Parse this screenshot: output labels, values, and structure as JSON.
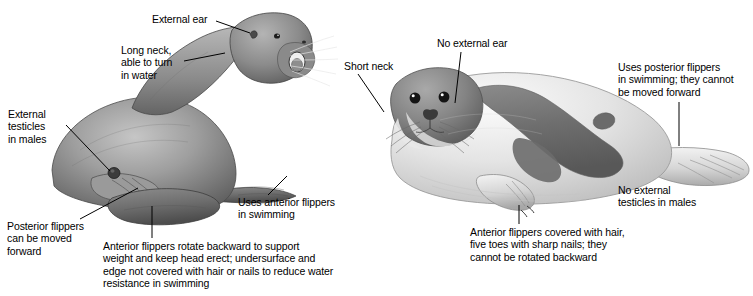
{
  "figure": {
    "background_color": "#ffffff",
    "text_color": "#000000",
    "width": 753,
    "height": 296
  },
  "sea_lion": {
    "name": "sea-lion",
    "labels": [
      {
        "id": "external-ear",
        "text": "External ear"
      },
      {
        "id": "long-neck",
        "text": "Long neck,\nable to turn\nin water"
      },
      {
        "id": "external-testicles",
        "text": "External\ntesticles\nin males"
      },
      {
        "id": "posterior-flippers",
        "text": "Posterior flippers\ncan be moved\nforward"
      },
      {
        "id": "anterior-flippers-rotate",
        "text": "Anterior flippers rotate backward to support\nweight and keep head erect; undersurface and\nedge not covered with hair or nails to reduce water\nresistance in swimming"
      },
      {
        "id": "uses-anterior-flippers",
        "text": "Uses anterior flippers\nin swimming"
      }
    ]
  },
  "seal": {
    "name": "true-seal",
    "labels": [
      {
        "id": "short-neck",
        "text": "Short neck"
      },
      {
        "id": "no-external-ear",
        "text": "No external ear"
      },
      {
        "id": "uses-posterior-flippers",
        "text": "Uses posterior flippers\nin swimming; they cannot\nbe moved forward"
      },
      {
        "id": "no-external-testicles",
        "text": "No external\ntesticles in males"
      },
      {
        "id": "anterior-flippers-hair",
        "text": "Anterior flippers covered with hair,\nfive toes with sharp nails; they\ncannot be rotated backward"
      }
    ]
  },
  "colors": {
    "ink": "#000000",
    "sea_lion_body_light": "#b9b9b9",
    "sea_lion_body_mid": "#8f8f8f",
    "sea_lion_body_dark": "#5d5d5d",
    "seal_body_light": "#ececec",
    "seal_body_mid": "#c9c9c9",
    "seal_patch_dark": "#6f6f6f",
    "background": "#ffffff"
  }
}
